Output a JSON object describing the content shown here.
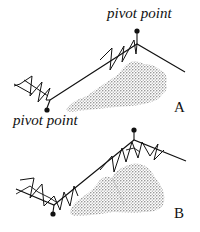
{
  "figure": {
    "panels": [
      {
        "id": "A",
        "label": "A",
        "annotations": [
          {
            "text": "pivot point",
            "target": "upper pivot (right end of spring)"
          },
          {
            "text": "pivot point",
            "target": "lower pivot (left end of spring)"
          }
        ]
      },
      {
        "id": "B",
        "label": "B",
        "annotations": [
          {
            "text": "pivot point",
            "target": "pivot points at spring junctions"
          }
        ]
      }
    ],
    "colors": {
      "line": "#111111",
      "shading": "#9a9a9a",
      "background": "#ffffff"
    }
  }
}
